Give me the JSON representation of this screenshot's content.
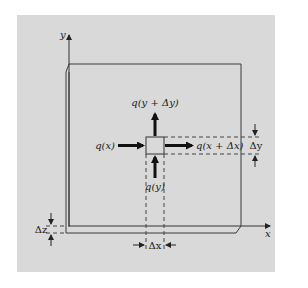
{
  "figure": {
    "background_color": "#d9d9d9",
    "page_color": "#ffffff",
    "line_color": "#3a3a3a",
    "axes": {
      "x_label": "x",
      "y_label": "y"
    },
    "element": {
      "description": "small control-volume square on a plate of thickness Δz"
    },
    "flux_labels": {
      "q_x": "q(x)",
      "q_x_dx": "q(x + Δx)",
      "q_y": "q(y)",
      "q_y_dy": "q(y + Δy)"
    },
    "dimension_labels": {
      "dx": "Δx",
      "dy": "Δy",
      "dz": "Δz"
    }
  }
}
